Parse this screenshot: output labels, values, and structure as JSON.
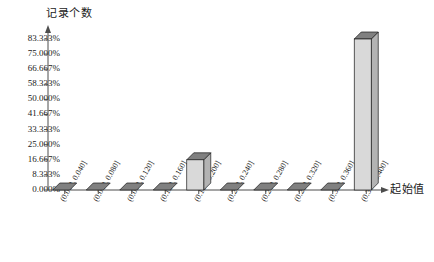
{
  "chart_data": {
    "type": "bar",
    "title": "",
    "subtitle": "",
    "ylabel": "记录个数",
    "xlabel": "起始值",
    "categories": [
      "(0.000, 0.040]",
      "(0.040, 0.080]",
      "(0.080, 0.120]",
      "(0.120, 0.160]",
      "(0.160, 0.200]",
      "(0.200, 0.240]",
      "(0.240, 0.280]",
      "(0.280, 0.320]",
      "(0.320, 0.360]",
      "(0.360, 0.400]"
    ],
    "values": [
      0,
      0,
      0,
      0,
      16.667,
      0,
      0,
      0,
      0,
      83.333
    ],
    "value_unit": "%",
    "ytick_labels": [
      "0.000%",
      "8.333%",
      "16.667%",
      "25.000%",
      "33.333%",
      "41.667%",
      "50.000%",
      "58.333%",
      "66.667%",
      "75.000%",
      "83.333%"
    ],
    "ytick_values": [
      0,
      8.333,
      16.667,
      25.0,
      33.333,
      41.667,
      50.0,
      58.333,
      66.667,
      75.0,
      83.333
    ],
    "ylim": [
      0,
      83.333
    ],
    "grid": false,
    "legend": null,
    "bar_style": "3d",
    "colors": {
      "bar_front": "#d9d9d9",
      "bar_top": "#808080",
      "bar_side": "#b3b3b3",
      "bar_outline": "#1a1a1a",
      "axis": "#4d4d4d",
      "text": "#1a1a1a",
      "background": "#ffffff"
    }
  }
}
